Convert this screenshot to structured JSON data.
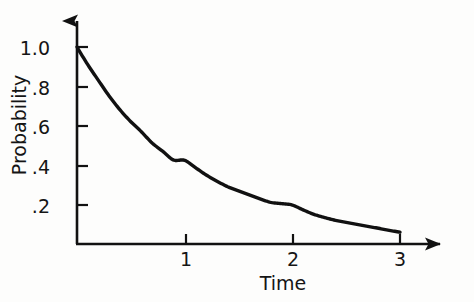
{
  "chart_data": {
    "type": "line",
    "title": "",
    "subtitle": "",
    "xlabel": "Time",
    "ylabel": "Probability",
    "xlim": [
      0,
      3.5
    ],
    "ylim": [
      0,
      1.08
    ],
    "grid": false,
    "legend": null,
    "x_ticks": [
      {
        "value": 1,
        "label": "1"
      },
      {
        "value": 2,
        "label": "2"
      },
      {
        "value": 3,
        "label": "3"
      }
    ],
    "y_ticks": [
      {
        "value": 1.0,
        "label": "1.0"
      },
      {
        "value": 0.8,
        "label": ".8"
      },
      {
        "value": 0.6,
        "label": ".6"
      },
      {
        "value": 0.4,
        "label": ".4"
      },
      {
        "value": 0.2,
        "label": ".2"
      }
    ],
    "series": [
      {
        "name": "Probability decay",
        "color": "#111111",
        "x": [
          0,
          0.1,
          0.2,
          0.3,
          0.4,
          0.5,
          0.6,
          0.7,
          0.8,
          0.9,
          1.0,
          1.2,
          1.4,
          1.6,
          1.8,
          2.0,
          2.2,
          2.4,
          2.6,
          2.8,
          3.0
        ],
        "values": [
          1.0,
          0.91,
          0.83,
          0.75,
          0.68,
          0.62,
          0.57,
          0.51,
          0.47,
          0.42,
          0.43,
          0.35,
          0.29,
          0.25,
          0.21,
          0.2,
          0.15,
          0.12,
          0.1,
          0.08,
          0.06
        ]
      }
    ],
    "axis_style": {
      "x_arrow": true,
      "y_arrow": true,
      "spine_color": "#111111"
    }
  },
  "labels": {
    "y_axis_title": "Probability",
    "x_axis_title": "Time",
    "y_tick_1_0": "1.0",
    "y_tick_0_8": ".8",
    "y_tick_0_6": ".6",
    "y_tick_0_4": ".4",
    "y_tick_0_2": ".2",
    "x_tick_1": "1",
    "x_tick_2": "2",
    "x_tick_3": "3"
  }
}
